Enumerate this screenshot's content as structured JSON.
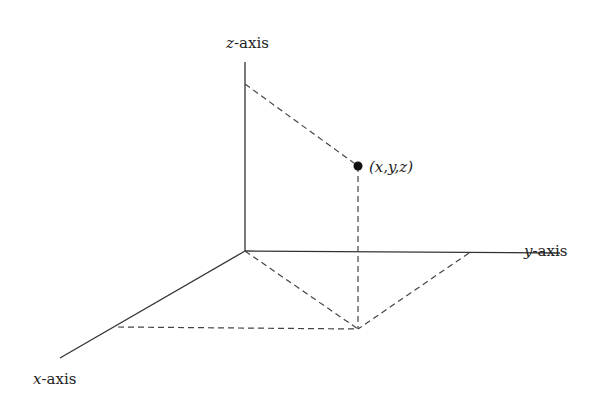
{
  "diagram": {
    "labels": {
      "z_axis": {
        "var": "z",
        "suffix": "-axis"
      },
      "y_axis": {
        "var": "y",
        "suffix": "-axis"
      },
      "x_axis": {
        "var": "x",
        "suffix": "-axis"
      },
      "point": "(x,y,z)"
    },
    "geometry": {
      "origin": [
        245,
        251
      ],
      "z_axis_top": [
        245,
        62
      ],
      "y_axis_end": [
        560,
        251
      ],
      "x_axis_end": [
        60,
        358
      ],
      "z_projection_on_axis": [
        245,
        84
      ],
      "point": [
        358,
        166
      ],
      "xy_projection": [
        358,
        329
      ],
      "x_axis_corner": [
        118,
        327
      ],
      "y_axis_corner": [
        469,
        253
      ]
    },
    "colors": {
      "line": "#333333",
      "point": "#111111"
    }
  }
}
